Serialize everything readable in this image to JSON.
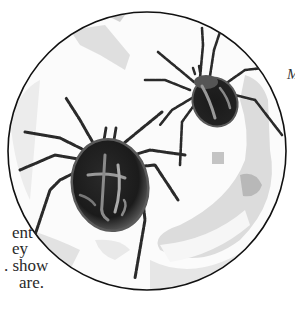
{
  "image": {
    "subject": "Watercolor illustration of two spiders inside a magnifying circle",
    "colors": {
      "background": "#ffffff",
      "circle_outline": "#111111",
      "wash": "#d9d9d9",
      "body_dark": "#1e1e1e",
      "body_mid": "#4a4a4a",
      "highlight": "#9a9a9a"
    }
  },
  "left_text": {
    "lines": [
      "ent",
      "ey",
      ". show",
      "are."
    ]
  },
  "right_text": {
    "fragment": "M"
  }
}
